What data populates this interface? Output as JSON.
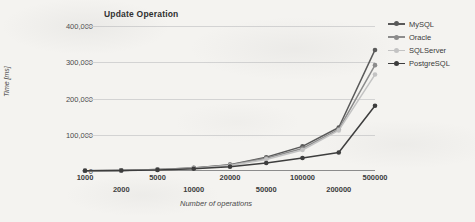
{
  "chart_data": {
    "type": "line",
    "title": "Update Operation",
    "xlabel": "Number of operations",
    "ylabel": "Time [ms]",
    "categories": [
      "1000",
      "2000",
      "5000",
      "10000",
      "20000",
      "50000",
      "100000",
      "200000",
      "500000"
    ],
    "yticks": [
      "0",
      "100,000",
      "200,000",
      "300,000",
      "400,000"
    ],
    "ylim": [
      0,
      400000
    ],
    "grid": true,
    "legend_position": "right",
    "series": [
      {
        "name": "MySQL",
        "color": "#595959",
        "values": [
          900,
          1700,
          4200,
          8500,
          17500,
          38000,
          68000,
          120000,
          334000
        ]
      },
      {
        "name": "Oracle",
        "color": "#8c8c8c",
        "values": [
          800,
          1600,
          4000,
          8000,
          16500,
          35000,
          62000,
          115000,
          292000
        ]
      },
      {
        "name": "SQLServer",
        "color": "#c3c3c3",
        "values": [
          700,
          1400,
          3600,
          7200,
          15000,
          32000,
          58000,
          112000,
          266000
        ]
      },
      {
        "name": "PostgreSQL",
        "color": "#3d3d3d",
        "values": [
          600,
          1200,
          3000,
          6000,
          12000,
          22000,
          36000,
          51000,
          180000
        ]
      }
    ]
  }
}
